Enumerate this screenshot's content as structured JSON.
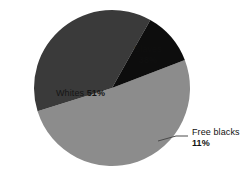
{
  "chart_data": {
    "type": "pie",
    "title": "",
    "subtitle": "",
    "xlabel": "",
    "ylabel": "",
    "legend_position": "none",
    "grid": false,
    "labels": [
      "Whites",
      "Slaves",
      "Free blacks"
    ],
    "values": [
      51,
      38,
      11
    ],
    "value_suffix": "%",
    "colors": [
      "#8c8c8c",
      "#3a3a3a",
      "#0d0d0d"
    ],
    "background": "#ffffff",
    "slices": [
      {
        "name": "Whites",
        "value": 51,
        "value_text": "51%",
        "color": "#8c8c8c",
        "label_placement": "inside",
        "label_text": "Whites 51%"
      },
      {
        "name": "Slaves",
        "value": 38,
        "value_text": "38%",
        "color": "#3a3a3a",
        "label_placement": "inside",
        "label_text": "Slaves 38%"
      },
      {
        "name": "Free blacks",
        "value": 11,
        "value_text": "11%",
        "color": "#0d0d0d",
        "label_placement": "callout",
        "label_text": "Free blacks 11%"
      }
    ]
  },
  "geometry": {
    "center_x": 112,
    "center_y": 88,
    "radius": 78,
    "start_angle_deg": -21
  },
  "callout": {
    "line_color": "#4a4a4a",
    "from_x": 158,
    "from_y": 141,
    "to_x": 188,
    "to_y": 136
  }
}
